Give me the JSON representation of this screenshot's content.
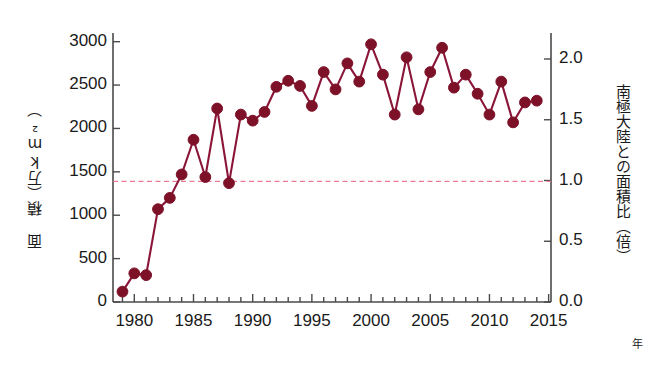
{
  "chart_data": {
    "type": "line",
    "title": "",
    "subtitle": "",
    "xlabel": "年",
    "ylabel": "面 積（万km²）",
    "ylabel_right": "南極大陸との面積比（倍）",
    "xlim": [
      1978.2,
      2015.2
    ],
    "ylim": [
      0,
      3100
    ],
    "ylim_right": [
      0,
      2.214
    ],
    "grid": false,
    "legend": null,
    "marker": "filled-circle",
    "series_color": "#7d1128",
    "line_color": "#8a1538",
    "reference_line": {
      "label": "南極大陸の面積（比 1.0）",
      "y_value": 1390,
      "y_value_right": 1.0,
      "color": "#e87b91",
      "style": "dashed"
    },
    "x": [
      1979,
      1980,
      1981,
      1982,
      1983,
      1984,
      1985,
      1986,
      1987,
      1988,
      1989,
      1990,
      1991,
      1992,
      1993,
      1994,
      1995,
      1996,
      1997,
      1998,
      1999,
      2000,
      2001,
      2002,
      2003,
      2004,
      2005,
      2006,
      2007,
      2008,
      2009,
      2010,
      2011,
      2012,
      2013,
      2014
    ],
    "values": [
      120,
      330,
      310,
      1070,
      1200,
      1470,
      1870,
      1440,
      2230,
      1370,
      2160,
      2090,
      2190,
      2480,
      2550,
      2490,
      2260,
      2650,
      2450,
      2750,
      2540,
      2970,
      2620,
      2160,
      2820,
      2220,
      2650,
      2930,
      2470,
      2620,
      2400,
      2160,
      2540,
      2070,
      2300,
      2320
    ],
    "units": "万km²",
    "xticks": [
      1980,
      1985,
      1990,
      1995,
      2000,
      2005,
      2010,
      2015
    ],
    "xticklabels": [
      "1980",
      "1985",
      "1990",
      "1995",
      "2000",
      "2005",
      "2010",
      "2015"
    ],
    "xminor_step": 1,
    "yticks_left": [
      0,
      500,
      1000,
      1500,
      2000,
      2500,
      3000
    ],
    "yticklabels_left": [
      "0",
      "500",
      "1000",
      "1500",
      "2000",
      "2500",
      "3000"
    ],
    "yticks_right": [
      0.0,
      0.5,
      1.0,
      1.5,
      2.0
    ],
    "yticklabels_right": [
      "0.0",
      "0.5",
      "1.0",
      "1.5",
      "2.0"
    ]
  }
}
